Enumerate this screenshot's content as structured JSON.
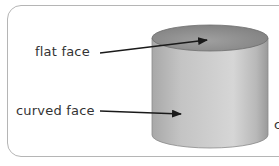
{
  "diagram": {
    "shape": "cylinder",
    "labels": {
      "flat_face": "flat face",
      "curved_face": "curved face",
      "partial_right": "c"
    },
    "colors": {
      "border": "#b5b5b5",
      "cylinder_side_light": "#d2d2d2",
      "cylinder_side_dark": "#9a9a9a",
      "cylinder_top": "#8f8f8f",
      "arrow": "#1a1a1a",
      "text": "#333333"
    }
  }
}
